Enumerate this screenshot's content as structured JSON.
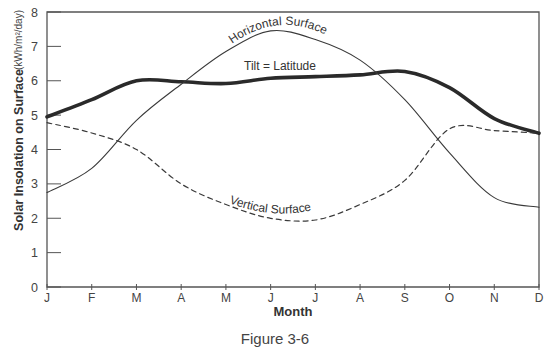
{
  "caption": "Figure 3-6",
  "chart_data": {
    "type": "line",
    "title": "",
    "xlabel": "Month",
    "ylabel": "Solar Insolation on Surface",
    "yunits": "(kWh/m²/day)",
    "categories": [
      "J",
      "F",
      "M",
      "A",
      "M",
      "J",
      "J",
      "A",
      "S",
      "O",
      "N",
      "D"
    ],
    "yticks": [
      0,
      1,
      2,
      3,
      4,
      5,
      6,
      7,
      8
    ],
    "ylim": [
      0,
      8
    ],
    "grid": false,
    "legend": "inline labels",
    "series": [
      {
        "name": "Tilt = Latitude",
        "style": "thick-solid",
        "values": [
          4.95,
          5.45,
          6.0,
          5.97,
          5.92,
          6.07,
          6.12,
          6.17,
          6.27,
          5.8,
          4.9,
          4.47
        ]
      },
      {
        "name": "Horizontal Surface",
        "style": "thin-solid",
        "values": [
          2.75,
          3.45,
          4.85,
          5.9,
          6.85,
          7.45,
          7.2,
          6.6,
          5.45,
          3.9,
          2.6,
          2.32
        ]
      },
      {
        "name": "Vertical Surface",
        "style": "dashed",
        "values": [
          4.78,
          4.48,
          4.0,
          3.0,
          2.4,
          2.0,
          1.95,
          2.4,
          3.1,
          4.6,
          4.55,
          4.47
        ]
      }
    ]
  }
}
